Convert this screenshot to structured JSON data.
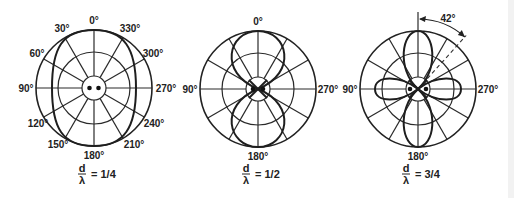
{
  "figure": {
    "panels": [
      {
        "id": "quarter",
        "center": [
          94,
          88
        ],
        "outer_radius": 58,
        "middle_radius": 36,
        "inner_radius": 12,
        "angle_labels": [
          {
            "text": "0°",
            "x": 94,
            "y": 24
          },
          {
            "text": "30°",
            "x": 62,
            "y": 32
          },
          {
            "text": "330°",
            "x": 130,
            "y": 32
          },
          {
            "text": "60°",
            "x": 37,
            "y": 57
          },
          {
            "text": "300°",
            "x": 153,
            "y": 57
          },
          {
            "text": "90°",
            "x": 26,
            "y": 92
          },
          {
            "text": "270°",
            "x": 166,
            "y": 92
          },
          {
            "text": "120°",
            "x": 38,
            "y": 127
          },
          {
            "text": "240°",
            "x": 154,
            "y": 127
          },
          {
            "text": "150°",
            "x": 58,
            "y": 148
          },
          {
            "text": "210°",
            "x": 134,
            "y": 148
          },
          {
            "text": "180°",
            "x": 94,
            "y": 159
          }
        ],
        "ratio_label": {
          "numerator": "d",
          "denominator": "λ",
          "value": "= 1/4"
        },
        "pattern": "broad-ellipse"
      },
      {
        "id": "half",
        "center": [
          258,
          89
        ],
        "outer_radius": 58,
        "middle_radius": 36,
        "inner_radius": 12,
        "angle_labels": [
          {
            "text": "0°",
            "x": 258,
            "y": 25
          },
          {
            "text": "90°",
            "x": 190,
            "y": 93
          },
          {
            "text": "270°",
            "x": 328,
            "y": 93
          },
          {
            "text": "180°",
            "x": 258,
            "y": 160
          }
        ],
        "ratio_label": {
          "numerator": "d",
          "denominator": "λ",
          "value": "= 1/2"
        },
        "pattern": "figure-eight-vertical"
      },
      {
        "id": "three-quarter",
        "center": [
          418,
          89
        ],
        "outer_radius": 58,
        "middle_radius": 36,
        "inner_radius": 12,
        "angle_labels": [
          {
            "text": "90°",
            "x": 350,
            "y": 93
          },
          {
            "text": "270°",
            "x": 488,
            "y": 93
          },
          {
            "text": "180°",
            "x": 418,
            "y": 160
          }
        ],
        "annotation": {
          "text": "42°",
          "angle_deg": 42
        },
        "ratio_label": {
          "numerator": "d",
          "denominator": "λ",
          "value": "= 3/4"
        },
        "pattern": "four-lobe"
      }
    ]
  }
}
